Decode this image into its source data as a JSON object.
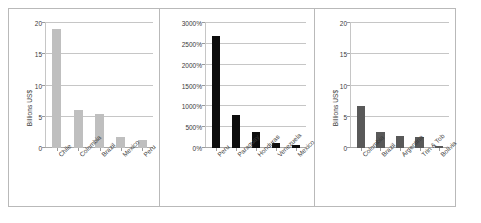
{
  "figure": {
    "panel_count": 3,
    "background": "#ffffff",
    "border_color": "#b9b9b9"
  },
  "chart_data": [
    {
      "type": "bar",
      "panel": "left",
      "title": "",
      "xlabel": "",
      "ylabel": "Billions US$",
      "categories": [
        "Chile",
        "Colombia",
        "Brazil",
        "Mexico",
        "Peru"
      ],
      "values": [
        19.0,
        6.1,
        5.4,
        1.7,
        1.3
      ],
      "yticks": [
        "0",
        "5",
        "10",
        "15",
        "20"
      ],
      "ytick_values": [
        0,
        5,
        10,
        15,
        20
      ],
      "ylim": [
        0,
        20
      ],
      "grid": true,
      "legend": "none",
      "bar_color": "#bfbfbf"
    },
    {
      "type": "bar",
      "panel": "middle",
      "title": "",
      "xlabel": "",
      "ylabel": "",
      "categories": [
        "Peru",
        "Paraguay",
        "Honduras",
        "Venezuela",
        "Mexico"
      ],
      "values": [
        2700,
        790,
        390,
        130,
        70
      ],
      "yticks": [
        "0%",
        "500%",
        "1000%",
        "1500%",
        "2000%",
        "2500%",
        "3000%"
      ],
      "ytick_values": [
        0,
        500,
        1000,
        1500,
        2000,
        2500,
        3000
      ],
      "ylim": [
        0,
        3000
      ],
      "grid": true,
      "legend": "none",
      "bar_color": "#0d0d0d"
    },
    {
      "type": "bar",
      "panel": "right",
      "title": "",
      "xlabel": "",
      "ylabel": "Billions US$",
      "categories": [
        "Colombia",
        "Brazil",
        "Argentina",
        "Trin & Tob",
        "Bolivia"
      ],
      "values": [
        6.7,
        2.5,
        2.0,
        1.7,
        0.3
      ],
      "yticks": [
        "0",
        "5",
        "10",
        "15",
        "20"
      ],
      "ytick_values": [
        0,
        5,
        10,
        15,
        20
      ],
      "ylim": [
        0,
        20
      ],
      "grid": true,
      "legend": "none",
      "bar_color": "#595959"
    }
  ]
}
